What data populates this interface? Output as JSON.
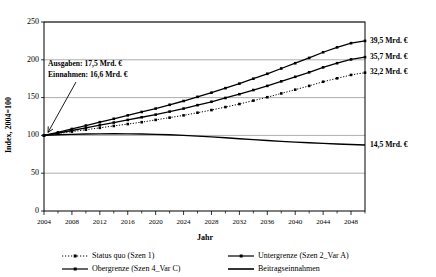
{
  "chart_data": {
    "type": "line",
    "title": "",
    "xlabel": "Jahr",
    "ylabel": "Index, 2004=100",
    "xlim": [
      2004,
      2050
    ],
    "ylim": [
      0,
      250
    ],
    "yticks": [
      0,
      50,
      100,
      150,
      200,
      250
    ],
    "xticks": [
      2004,
      2008,
      2012,
      2016,
      2020,
      2024,
      2028,
      2032,
      2036,
      2040,
      2044,
      2048
    ],
    "x_minor_step": 2,
    "grid": true,
    "legend_position": "bottom",
    "x": [
      2004,
      2006,
      2008,
      2010,
      2012,
      2014,
      2016,
      2018,
      2020,
      2022,
      2024,
      2026,
      2028,
      2030,
      2032,
      2034,
      2036,
      2038,
      2040,
      2042,
      2044,
      2046,
      2048,
      2050
    ],
    "series": [
      {
        "name": "Obergrenze (Szen 4_Var C)",
        "style": "solid-marker",
        "end_label": "39,5 Mrd. €",
        "values": [
          100,
          104,
          108.5,
          113,
          117.5,
          122,
          126.5,
          131,
          135.5,
          140.5,
          145.5,
          151,
          156.5,
          162.5,
          168.5,
          175,
          181.5,
          188.5,
          195.5,
          202.5,
          210,
          216.5,
          222,
          225
        ]
      },
      {
        "name": "Untergrenze (Szen 2_Var A)",
        "style": "solid-marker",
        "end_label": "35,7 Mrd. €",
        "values": [
          100,
          103,
          106.5,
          110,
          113.5,
          117,
          120.5,
          124,
          127.5,
          131.5,
          135.5,
          140,
          144.5,
          149.5,
          154.5,
          160,
          165.5,
          171.5,
          177.5,
          183.5,
          190,
          195.5,
          200.5,
          203.5
        ]
      },
      {
        "name": "Status quo (Szen 1)",
        "style": "dotted-marker",
        "end_label": "32,2 Mrd. €",
        "values": [
          100,
          102.5,
          105,
          107.5,
          110,
          112.5,
          115,
          117.5,
          120.5,
          123.5,
          126.5,
          130,
          133.5,
          137.5,
          141.5,
          146,
          150.5,
          155.5,
          160.5,
          165.5,
          171,
          175.5,
          180,
          183
        ]
      },
      {
        "name": "Beitragseinnahmen",
        "style": "solid-plain",
        "end_label": "14,5 Mrd. €",
        "values": [
          100,
          100.8,
          101.4,
          101.8,
          102,
          102.1,
          102,
          101.8,
          101.4,
          100.8,
          100,
          99,
          98,
          96.8,
          95.6,
          94.4,
          93.2,
          92.1,
          91.1,
          90.2,
          89.4,
          88.7,
          88,
          87.4
        ]
      }
    ],
    "annotation": {
      "line1": "Ausgaben: 17,5 Mrd. €",
      "line2": "Einnahmen: 16,6 Mrd. €",
      "points_to_year": 2004,
      "points_to_value": 100
    },
    "legend": [
      {
        "label": "Status quo (Szen 1)",
        "style": "dotted-marker"
      },
      {
        "label": "Untergrenze (Szen 2_Var A)",
        "style": "solid-marker"
      },
      {
        "label": "Obergrenze (Szen 4_Var C)",
        "style": "solid-marker"
      },
      {
        "label": "Beitragseinnahmen",
        "style": "solid-plain"
      }
    ]
  }
}
